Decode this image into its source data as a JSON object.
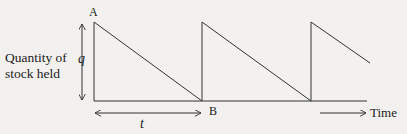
{
  "diagram": {
    "type": "sawtooth-inventory",
    "y_axis_label_lines": [
      "Quantity of",
      "stock held"
    ],
    "x_axis_label": "Time",
    "point_labels": {
      "peak": "A",
      "trough": "B"
    },
    "dimension_labels": {
      "quantity": "q",
      "period": "t"
    },
    "cycles": 3,
    "colors": {
      "line": "#333333",
      "background": "#f2f1ef"
    }
  }
}
